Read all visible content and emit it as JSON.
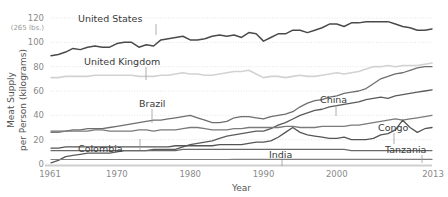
{
  "chart_data": {
    "type": "line",
    "title": "",
    "xlabel": "Year",
    "ylabel": "Meat Supply per Person (kilograms)",
    "y_note": "(265 lbs.)",
    "xlim": [
      1961,
      2013
    ],
    "ylim": [
      0,
      120
    ],
    "grid": true,
    "legend_position": "inline-labels",
    "yticks": [
      0,
      20,
      40,
      60,
      80,
      100,
      120
    ],
    "ytick_labels": [
      "0",
      "20",
      "40",
      "60",
      "80",
      "100",
      "120"
    ],
    "xticks": [
      1961,
      1970,
      1980,
      1990,
      2000,
      2013
    ],
    "xtick_labels": [
      "1961",
      "1970",
      "1980",
      "1990",
      "2000",
      "2013"
    ],
    "x": [
      1961,
      1962,
      1963,
      1964,
      1965,
      1966,
      1967,
      1968,
      1969,
      1970,
      1971,
      1972,
      1973,
      1974,
      1975,
      1976,
      1977,
      1978,
      1979,
      1980,
      1981,
      1982,
      1983,
      1984,
      1985,
      1986,
      1987,
      1988,
      1989,
      1990,
      1991,
      1992,
      1993,
      1994,
      1995,
      1996,
      1997,
      1998,
      1999,
      2000,
      2001,
      2002,
      2003,
      2004,
      2005,
      2006,
      2007,
      2008,
      2009,
      2010,
      2011,
      2012,
      2013
    ],
    "series": [
      {
        "name": "United States",
        "color": "#4a4a4a",
        "width": 1.5,
        "label_x": 1968,
        "label_y": 118,
        "values": [
          89,
          90,
          92,
          95,
          94,
          96,
          97,
          96,
          96,
          99,
          100,
          100,
          96,
          98,
          97,
          102,
          103,
          104,
          105,
          102,
          102,
          103,
          105,
          106,
          105,
          106,
          104,
          108,
          107,
          101,
          104,
          107,
          107,
          110,
          110,
          108,
          110,
          112,
          115,
          115,
          113,
          116,
          116,
          117,
          117,
          117,
          117,
          115,
          113,
          112,
          110,
          110,
          111
        ]
      },
      {
        "name": "United Kingdom",
        "color": "#d2d2d2",
        "width": 1.6,
        "label_x": 1971,
        "label_y": 84,
        "values": [
          71,
          71,
          72,
          72,
          72,
          72,
          73,
          73,
          73,
          73,
          73,
          73,
          72,
          72,
          72,
          73,
          73,
          74,
          75,
          74,
          74,
          73,
          73,
          74,
          75,
          76,
          76,
          77,
          74,
          71,
          72,
          72,
          71,
          72,
          73,
          72,
          72,
          73,
          74,
          75,
          74,
          75,
          76,
          78,
          80,
          80,
          81,
          80,
          81,
          81,
          81,
          82,
          83
        ]
      },
      {
        "name": "Brazil",
        "color": "#6e6e6e",
        "width": 1.3,
        "label_x": 1975,
        "label_y": 47,
        "values": [
          27,
          27,
          27,
          28,
          28,
          29,
          29,
          29,
          30,
          31,
          32,
          33,
          34,
          35,
          36,
          36,
          37,
          38,
          39,
          40,
          38,
          36,
          34,
          34,
          35,
          38,
          39,
          39,
          38,
          37,
          39,
          40,
          41,
          43,
          47,
          50,
          52,
          53,
          55,
          56,
          58,
          59,
          60,
          62,
          66,
          70,
          72,
          74,
          75,
          77,
          79,
          80,
          80
        ]
      },
      {
        "name": "China",
        "color": "#5a5a5a",
        "width": 1.3,
        "label_x": 1998,
        "label_y": 45,
        "values": [
          1,
          3,
          6,
          7,
          8,
          9,
          9,
          9,
          9,
          10,
          11,
          11,
          11,
          11,
          12,
          12,
          12,
          12,
          14,
          16,
          17,
          18,
          19,
          21,
          23,
          24,
          25,
          26,
          27,
          27,
          29,
          32,
          34,
          37,
          40,
          42,
          44,
          45,
          47,
          48,
          49,
          50,
          51,
          53,
          54,
          55,
          54,
          56,
          57,
          58,
          59,
          60,
          61
        ]
      },
      {
        "name": "Colombia",
        "color": "#7a7a7a",
        "width": 1.3,
        "label_x": 1968,
        "label_y": 19,
        "values": [
          26,
          26,
          27,
          27,
          27,
          27,
          28,
          28,
          27,
          27,
          27,
          27,
          28,
          28,
          27,
          28,
          28,
          28,
          29,
          30,
          30,
          29,
          28,
          28,
          28,
          29,
          29,
          30,
          30,
          30,
          30,
          30,
          31,
          31,
          30,
          30,
          30,
          31,
          31,
          31,
          31,
          32,
          32,
          33,
          34,
          35,
          36,
          37,
          36,
          37,
          38,
          39,
          40
        ]
      },
      {
        "name": "Congo",
        "color": "#555555",
        "width": 1.3,
        "label_x": 2003,
        "label_y": 33,
        "values": [
          13,
          13,
          14,
          14,
          14,
          14,
          14,
          14,
          14,
          14,
          14,
          14,
          14,
          14,
          14,
          14,
          14,
          15,
          15,
          15,
          15,
          15,
          15,
          16,
          16,
          16,
          16,
          17,
          18,
          18,
          19,
          22,
          26,
          30,
          26,
          24,
          23,
          22,
          21,
          21,
          22,
          20,
          20,
          20,
          21,
          24,
          25,
          28,
          36,
          30,
          26,
          29,
          30
        ]
      },
      {
        "name": "Tanzania",
        "color": "#6a6a6a",
        "width": 1.3,
        "label_x": 2004,
        "label_y": 22,
        "values": [
          11,
          11,
          11,
          11,
          11,
          11,
          11,
          11,
          11,
          11,
          11,
          11,
          11,
          11,
          11,
          11,
          11,
          11,
          12,
          12,
          12,
          12,
          12,
          12,
          12,
          12,
          12,
          12,
          12,
          12,
          12,
          12,
          12,
          12,
          12,
          12,
          12,
          12,
          12,
          12,
          12,
          11,
          11,
          11,
          11,
          11,
          11,
          11,
          11,
          11,
          11,
          11,
          11
        ]
      },
      {
        "name": "India",
        "color": "#808080",
        "width": 1.2,
        "label_x": 1992,
        "label_y": 10,
        "values": [
          3.7,
          3.7,
          3.7,
          3.7,
          3.7,
          3.7,
          3.7,
          3.7,
          3.7,
          3.7,
          3.7,
          3.7,
          3.7,
          3.7,
          3.7,
          3.7,
          3.7,
          3.7,
          3.7,
          3.7,
          3.7,
          3.7,
          3.7,
          3.7,
          3.7,
          3.8,
          3.8,
          3.8,
          3.8,
          3.8,
          3.8,
          3.8,
          3.8,
          3.8,
          3.8,
          3.8,
          3.8,
          3.8,
          3.8,
          3.8,
          3.8,
          3.8,
          3.8,
          3.8,
          3.8,
          3.8,
          3.8,
          3.8,
          3.8,
          3.8,
          3.8,
          3.8,
          3.8
        ]
      }
    ],
    "annotations": [
      {
        "text": "United States",
        "tx": 78,
        "ty": 22,
        "lx": 156,
        "ly": 24,
        "ly2": 35
      },
      {
        "text": "United Kingdom",
        "tx": 84,
        "ty": 65,
        "lx": 146,
        "ly": 67,
        "ly2": 80
      },
      {
        "text": "Brazil",
        "tx": 139,
        "ty": 107,
        "lx": 152,
        "ly": 109,
        "ly2": 123
      },
      {
        "text": "China",
        "tx": 320,
        "ty": 103,
        "lx": 336,
        "ly": 105,
        "ly2": 116
      },
      {
        "text": "Colombia",
        "tx": 78,
        "ty": 152,
        "lx": 140,
        "ly": 150,
        "ly2": 139
      },
      {
        "text": "Congo",
        "tx": 378,
        "ty": 131,
        "lx": 394,
        "ly": 133,
        "ly2": 144
      },
      {
        "text": "Tanzania",
        "tx": 385,
        "ty": 153,
        "lx": 422,
        "ly": 155,
        "ly2": 163
      },
      {
        "text": "India",
        "tx": 269,
        "ty": 158,
        "lx": 282,
        "ly": 160,
        "ly2": 166
      }
    ]
  }
}
